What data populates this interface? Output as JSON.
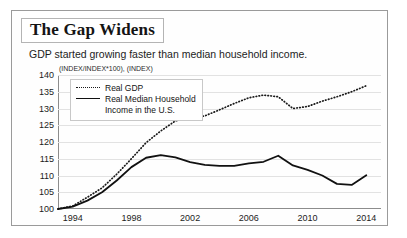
{
  "figure": {
    "title": "The Gap Widens",
    "subtitle": "GDP started growing faster than median household income.",
    "unit_label": "(INDEX/INDEX*100), (INDEX)"
  },
  "legend": {
    "position": "top-left-inside",
    "items": [
      {
        "label": "Real GDP",
        "style": "dotted",
        "color": "#1a1a1a"
      },
      {
        "label": "Real Median Household\nIncome in the U.S.",
        "style": "solid",
        "color": "#111111"
      }
    ]
  },
  "chart_data": {
    "type": "line",
    "title": "The Gap Widens",
    "subtitle": "GDP started growing faster than median household income.",
    "xlabel": "",
    "ylabel": "(INDEX/INDEX*100), (INDEX)",
    "xlim": [
      1993,
      2015
    ],
    "ylim": [
      100,
      140
    ],
    "ytick_values": [
      100,
      105,
      110,
      115,
      120,
      125,
      130,
      135,
      140
    ],
    "ytick_labels": [
      "100",
      "105",
      "110",
      "115",
      "120",
      "125",
      "130",
      "135",
      "140"
    ],
    "xtick_values": [
      1994,
      1998,
      2002,
      2006,
      2010,
      2014
    ],
    "xtick_labels": [
      "1994",
      "1998",
      "2002",
      "2006",
      "2010",
      "2014"
    ],
    "grid": "horizontal",
    "x": [
      1993,
      1994,
      1995,
      1996,
      1997,
      1998,
      1999,
      2000,
      2001,
      2002,
      2003,
      2004,
      2005,
      2006,
      2007,
      2008,
      2009,
      2010,
      2011,
      2012,
      2013,
      2014
    ],
    "series": [
      {
        "name": "Real GDP",
        "style": "dotted",
        "color": "#1a1a1a",
        "values": [
          100.0,
          100.9,
          103.5,
          106.3,
          110.4,
          115.0,
          119.8,
          123.3,
          126.3,
          127.3,
          127.8,
          129.6,
          131.5,
          133.2,
          134.0,
          133.5,
          130.0,
          130.6,
          132.2,
          133.5,
          135.0,
          136.8
        ]
      },
      {
        "name": "Real Median Household Income in the U.S.",
        "style": "solid",
        "color": "#111111",
        "values": [
          100.0,
          100.7,
          102.5,
          105.0,
          108.5,
          112.5,
          115.3,
          116.1,
          115.4,
          114.0,
          113.2,
          112.9,
          112.9,
          113.6,
          114.1,
          115.9,
          113.0,
          111.7,
          110.0,
          107.5,
          107.2,
          110.1
        ]
      }
    ],
    "annotations": []
  }
}
